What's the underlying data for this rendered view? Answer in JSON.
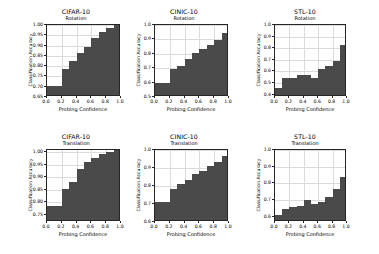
{
  "figure": {
    "background": "#ffffff",
    "bar_color": "#4a4a4a",
    "grid_color": "#dcdcdc",
    "axis_color": "#262626",
    "rows": 2,
    "cols": 3
  },
  "chart_data": [
    {
      "type": "bar",
      "title": "CIFAR-10",
      "subtitle": "Rotation",
      "xlabel": "Probing Confidence",
      "ylabel": "Classification Accuracy",
      "xlim": [
        0.0,
        1.0
      ],
      "ylim": [
        0.65,
        1.0
      ],
      "xticks": [
        0.0,
        0.2,
        0.4,
        0.6,
        0.8,
        1.0
      ],
      "xticklabels": [
        "0.0",
        "0.2",
        "0.4",
        "0.6",
        "0.8",
        "1.0"
      ],
      "yticks": [
        0.65,
        0.7,
        0.75,
        0.8,
        0.85,
        0.9,
        0.95,
        1.0
      ],
      "yticklabels": [
        "0.65",
        "0.70",
        "0.75",
        "0.80",
        "0.85",
        "0.90",
        "0.95",
        "1.00"
      ],
      "grid": true,
      "bin_edges": [
        0.0,
        0.1,
        0.2,
        0.3,
        0.4,
        0.5,
        0.6,
        0.7,
        0.8,
        0.9,
        1.0
      ],
      "categories": [
        "0.0-0.1",
        "0.1-0.2",
        "0.2-0.3",
        "0.3-0.4",
        "0.4-0.5",
        "0.5-0.6",
        "0.6-0.7",
        "0.7-0.8",
        "0.8-0.9",
        "0.9-1.0"
      ],
      "values": [
        0.695,
        0.695,
        0.775,
        0.815,
        0.855,
        0.885,
        0.925,
        0.955,
        0.975,
        1.0
      ]
    },
    {
      "type": "bar",
      "title": "CINIC-10",
      "subtitle": "Rotation",
      "xlabel": "Probing Confidence",
      "ylabel": "Classification Accuracy",
      "xlim": [
        0.0,
        1.0
      ],
      "ylim": [
        0.5,
        1.0
      ],
      "xticks": [
        0.0,
        0.2,
        0.4,
        0.6,
        0.8,
        1.0
      ],
      "xticklabels": [
        "0.0",
        "0.2",
        "0.4",
        "0.6",
        "0.8",
        "1.0"
      ],
      "yticks": [
        0.5,
        0.6,
        0.7,
        0.8,
        0.9,
        1.0
      ],
      "yticklabels": [
        "0.5",
        "0.6",
        "0.7",
        "0.8",
        "0.9",
        "1.0"
      ],
      "grid": true,
      "bin_edges": [
        0.0,
        0.1,
        0.2,
        0.3,
        0.4,
        0.5,
        0.6,
        0.7,
        0.8,
        0.9,
        1.0
      ],
      "categories": [
        "0.0-0.1",
        "0.1-0.2",
        "0.2-0.3",
        "0.3-0.4",
        "0.4-0.5",
        "0.5-0.6",
        "0.6-0.7",
        "0.7-0.8",
        "0.8-0.9",
        "0.9-1.0"
      ],
      "values": [
        0.58,
        0.58,
        0.68,
        0.7,
        0.75,
        0.79,
        0.82,
        0.85,
        0.88,
        0.93
      ]
    },
    {
      "type": "bar",
      "title": "STL-10",
      "subtitle": "Rotation",
      "xlabel": "Probing Confidence",
      "ylabel": "Classification Accuracy",
      "xlim": [
        0.0,
        1.0
      ],
      "ylim": [
        0.38,
        1.0
      ],
      "xticks": [
        0.0,
        0.2,
        0.4,
        0.6,
        0.8,
        1.0
      ],
      "xticklabels": [
        "0.0",
        "0.2",
        "0.4",
        "0.6",
        "0.8",
        "1.0"
      ],
      "yticks": [
        0.4,
        0.5,
        0.6,
        0.7,
        0.8,
        0.9,
        1.0
      ],
      "yticklabels": [
        "0.4",
        "0.5",
        "0.6",
        "0.7",
        "0.8",
        "0.9",
        "1.0"
      ],
      "grid": true,
      "bin_edges": [
        0.0,
        0.1,
        0.2,
        0.3,
        0.4,
        0.5,
        0.6,
        0.7,
        0.8,
        0.9,
        1.0
      ],
      "categories": [
        "0.0-0.1",
        "0.1-0.2",
        "0.2-0.3",
        "0.3-0.4",
        "0.4-0.5",
        "0.5-0.6",
        "0.6-0.7",
        "0.7-0.8",
        "0.8-0.9",
        "0.9-1.0"
      ],
      "values": [
        0.44,
        0.53,
        0.53,
        0.55,
        0.55,
        0.53,
        0.6,
        0.63,
        0.67,
        0.81
      ]
    },
    {
      "type": "bar",
      "title": "CIFAR-10",
      "subtitle": "Translation",
      "xlabel": "Probing Confidence",
      "ylabel": "Classification Accuracy",
      "xlim": [
        0.0,
        1.0
      ],
      "ylim": [
        0.72,
        1.01
      ],
      "xticks": [
        0.0,
        0.2,
        0.4,
        0.6,
        0.8,
        1.0
      ],
      "xticklabels": [
        "0.0",
        "0.2",
        "0.4",
        "0.6",
        "0.8",
        "1.0"
      ],
      "yticks": [
        0.75,
        0.8,
        0.85,
        0.9,
        0.95,
        1.0
      ],
      "yticklabels": [
        "0.75",
        "0.80",
        "0.85",
        "0.90",
        "0.95",
        "1.00"
      ],
      "grid": true,
      "bin_edges": [
        0.0,
        0.1,
        0.2,
        0.3,
        0.4,
        0.5,
        0.6,
        0.7,
        0.8,
        0.9,
        1.0
      ],
      "categories": [
        "0.0-0.1",
        "0.1-0.2",
        "0.2-0.3",
        "0.3-0.4",
        "0.4-0.5",
        "0.5-0.6",
        "0.6-0.7",
        "0.7-0.8",
        "0.8-0.9",
        "0.9-1.0"
      ],
      "values": [
        0.775,
        0.775,
        0.845,
        0.875,
        0.925,
        0.955,
        0.97,
        0.985,
        0.995,
        1.0
      ]
    },
    {
      "type": "bar",
      "title": "CINIC-10",
      "subtitle": "Translation",
      "xlabel": "Probing Confidence",
      "ylabel": "Classification Accuracy",
      "xlim": [
        0.0,
        1.0
      ],
      "ylim": [
        0.6,
        1.0
      ],
      "xticks": [
        0.0,
        0.2,
        0.4,
        0.6,
        0.8,
        1.0
      ],
      "xticklabels": [
        "0.0",
        "0.2",
        "0.4",
        "0.6",
        "0.8",
        "1.0"
      ],
      "yticks": [
        0.6,
        0.7,
        0.8,
        0.9,
        1.0
      ],
      "yticklabels": [
        "0.6",
        "0.7",
        "0.8",
        "0.9",
        "1.0"
      ],
      "grid": true,
      "bin_edges": [
        0.0,
        0.1,
        0.2,
        0.3,
        0.4,
        0.5,
        0.6,
        0.7,
        0.8,
        0.9,
        1.0
      ],
      "categories": [
        "0.0-0.1",
        "0.1-0.2",
        "0.2-0.3",
        "0.3-0.4",
        "0.4-0.5",
        "0.5-0.6",
        "0.6-0.7",
        "0.7-0.8",
        "0.8-0.9",
        "0.9-1.0"
      ],
      "values": [
        0.7,
        0.7,
        0.775,
        0.8,
        0.825,
        0.855,
        0.875,
        0.9,
        0.925,
        0.955
      ]
    },
    {
      "type": "bar",
      "title": "STL-10",
      "subtitle": "Translation",
      "xlabel": "Probing Confidence",
      "ylabel": "Classification Accuracy",
      "xlim": [
        0.0,
        1.0
      ],
      "ylim": [
        0.57,
        1.0
      ],
      "xticks": [
        0.0,
        0.2,
        0.4,
        0.6,
        0.8,
        1.0
      ],
      "xticklabels": [
        "0.0",
        "0.2",
        "0.4",
        "0.6",
        "0.8",
        "1.0"
      ],
      "yticks": [
        0.6,
        0.7,
        0.8,
        0.9,
        1.0
      ],
      "yticklabels": [
        "0.6",
        "0.7",
        "0.8",
        "0.9",
        "1.0"
      ],
      "grid": true,
      "bin_edges": [
        0.0,
        0.1,
        0.2,
        0.3,
        0.4,
        0.5,
        0.6,
        0.7,
        0.8,
        0.9,
        1.0
      ],
      "categories": [
        "0.0-0.1",
        "0.1-0.2",
        "0.2-0.3",
        "0.3-0.4",
        "0.4-0.5",
        "0.5-0.6",
        "0.6-0.7",
        "0.7-0.8",
        "0.8-0.9",
        "0.9-1.0"
      ],
      "values": [
        0.6,
        0.635,
        0.645,
        0.655,
        0.69,
        0.665,
        0.675,
        0.705,
        0.755,
        0.825
      ]
    }
  ]
}
